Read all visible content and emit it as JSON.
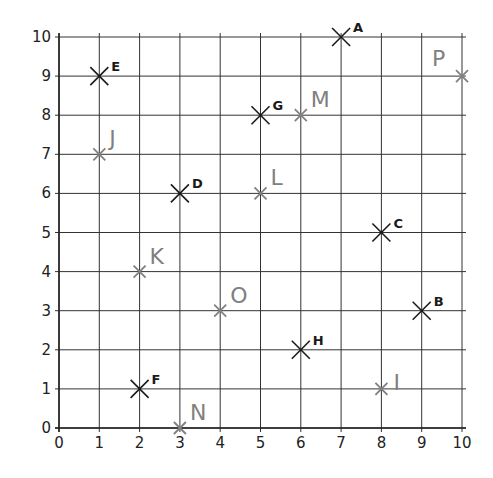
{
  "chart_data": {
    "type": "scatter",
    "title": "",
    "xlabel": "",
    "ylabel": "",
    "xlim": [
      0,
      10
    ],
    "ylim": [
      0,
      10
    ],
    "grid": true,
    "x_ticks": [
      "0",
      "1",
      "2",
      "3",
      "4",
      "5",
      "6",
      "7",
      "8",
      "9",
      "10"
    ],
    "y_ticks": [
      "0",
      "1",
      "2",
      "3",
      "4",
      "5",
      "6",
      "7",
      "8",
      "9",
      "10"
    ],
    "series": [
      {
        "name": "black-points",
        "color": "#1a1a1a",
        "points": [
          {
            "label": "A",
            "x": 7,
            "y": 10
          },
          {
            "label": "B",
            "x": 9,
            "y": 3
          },
          {
            "label": "C",
            "x": 8,
            "y": 5
          },
          {
            "label": "D",
            "x": 3,
            "y": 6
          },
          {
            "label": "E",
            "x": 1,
            "y": 9
          },
          {
            "label": "F",
            "x": 2,
            "y": 1
          },
          {
            "label": "G",
            "x": 5,
            "y": 8
          },
          {
            "label": "H",
            "x": 6,
            "y": 2
          }
        ]
      },
      {
        "name": "grey-points",
        "color": "#808080",
        "points": [
          {
            "label": "I",
            "x": 8,
            "y": 1
          },
          {
            "label": "J",
            "x": 1,
            "y": 7
          },
          {
            "label": "K",
            "x": 2,
            "y": 4
          },
          {
            "label": "L",
            "x": 5,
            "y": 6
          },
          {
            "label": "M",
            "x": 6,
            "y": 8
          },
          {
            "label": "N",
            "x": 3,
            "y": 0
          },
          {
            "label": "O",
            "x": 4,
            "y": 3
          },
          {
            "label": "P",
            "x": 10,
            "y": 9
          }
        ]
      }
    ]
  },
  "layout": {
    "x0": 59,
    "x1": 462,
    "y0": 428,
    "y1": 37
  }
}
